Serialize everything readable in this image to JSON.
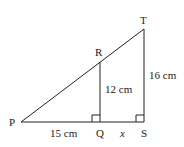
{
  "diagram": {
    "type": "similar-triangles",
    "stroke_color": "#222222",
    "background": "#ffffff",
    "vertices": {
      "P": {
        "label": "P"
      },
      "Q": {
        "label": "Q"
      },
      "R": {
        "label": "R"
      },
      "S": {
        "label": "S"
      },
      "T": {
        "label": "T"
      }
    },
    "measurements": {
      "PQ": "15 cm",
      "QR": "12 cm",
      "ST": "16 cm",
      "QS": "x"
    },
    "right_angles": [
      "Q",
      "S"
    ]
  }
}
